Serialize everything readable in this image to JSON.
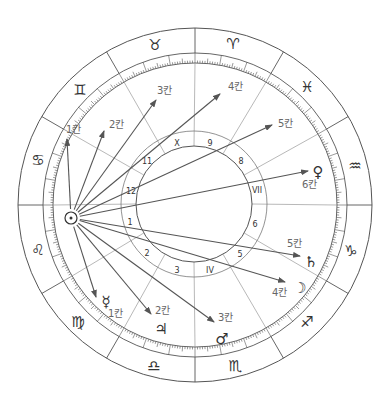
{
  "chart": {
    "center": [
      195,
      205
    ],
    "outer_radius": 177,
    "zodiac_inner_radius": 152,
    "scale_inner_radius": 142,
    "house_center": [
      194,
      204
    ],
    "house_outer_radius": 73,
    "house_inner_radius": 58,
    "line_color": "#555555",
    "arrow_color": "#555555"
  },
  "signs": [
    {
      "name": "aries",
      "glyph": "♈",
      "x": 233,
      "y": 44
    },
    {
      "name": "taurus",
      "glyph": "♉",
      "x": 155,
      "y": 45
    },
    {
      "name": "gemini",
      "glyph": "♊",
      "x": 80,
      "y": 90
    },
    {
      "name": "cancer",
      "glyph": "♋",
      "x": 38,
      "y": 160
    },
    {
      "name": "leo",
      "glyph": "♌",
      "x": 38,
      "y": 250
    },
    {
      "name": "virgo",
      "glyph": "♍",
      "x": 78,
      "y": 322
    },
    {
      "name": "libra",
      "glyph": "♎",
      "x": 154,
      "y": 366
    },
    {
      "name": "scorpio",
      "glyph": "♏",
      "x": 235,
      "y": 366
    },
    {
      "name": "sagittarius",
      "glyph": "♐",
      "x": 307,
      "y": 322
    },
    {
      "name": "capricorn",
      "glyph": "♑",
      "x": 351,
      "y": 251
    },
    {
      "name": "aquarius",
      "glyph": "♒",
      "x": 355,
      "y": 166
    },
    {
      "name": "pisces",
      "glyph": "♓",
      "x": 307,
      "y": 87
    }
  ],
  "houses": [
    {
      "label": "1",
      "x": 130,
      "y": 222
    },
    {
      "label": "2",
      "x": 147,
      "y": 253
    },
    {
      "label": "3",
      "x": 177,
      "y": 270
    },
    {
      "label": "IV",
      "x": 210,
      "y": 270
    },
    {
      "label": "5",
      "x": 240,
      "y": 254
    },
    {
      "label": "6",
      "x": 255,
      "y": 224
    },
    {
      "label": "VII",
      "x": 257,
      "y": 190
    },
    {
      "label": "8",
      "x": 241,
      "y": 161
    },
    {
      "label": "9",
      "x": 210,
      "y": 143
    },
    {
      "label": "X",
      "x": 177,
      "y": 143
    },
    {
      "label": "11",
      "x": 147,
      "y": 161
    },
    {
      "label": "12",
      "x": 131,
      "y": 191
    }
  ],
  "sun": {
    "name": "sun",
    "glyph": "☉",
    "x": 71,
    "y": 218,
    "r": 6
  },
  "aspects": [
    {
      "name": "arrow-1-up",
      "tip": [
        67,
        139
      ],
      "label": "1칸",
      "lx": 66,
      "ly": 133,
      "planet": null
    },
    {
      "name": "arrow-2-up",
      "tip": [
        104,
        131
      ],
      "label": "2칸",
      "lx": 109,
      "ly": 128,
      "planet": null
    },
    {
      "name": "arrow-3-up",
      "tip": [
        156,
        100
      ],
      "label": "3칸",
      "lx": 157,
      "ly": 94,
      "planet": null
    },
    {
      "name": "arrow-4-up",
      "tip": [
        220,
        94
      ],
      "label": "4칸",
      "lx": 228,
      "ly": 90,
      "planet": null
    },
    {
      "name": "arrow-5-up",
      "tip": [
        272,
        125
      ],
      "label": "5칸",
      "lx": 278,
      "ly": 127,
      "planet": null
    },
    {
      "name": "arrow-venus",
      "tip": [
        308,
        171
      ],
      "label": "6칸",
      "lx": 302,
      "ly": 188,
      "planet": {
        "name": "venus",
        "glyph": "♀",
        "x": 318,
        "y": 172
      }
    },
    {
      "name": "arrow-saturn",
      "tip": [
        300,
        256
      ],
      "label": "5칸",
      "lx": 287,
      "ly": 247,
      "planet": {
        "name": "saturn",
        "glyph": "♄",
        "x": 311,
        "y": 262
      }
    },
    {
      "name": "arrow-moon",
      "tip": [
        285,
        282
      ],
      "label": "4칸",
      "lx": 272,
      "ly": 296,
      "planet": {
        "name": "moon",
        "glyph": "☽",
        "x": 300,
        "y": 288
      }
    },
    {
      "name": "arrow-mars",
      "tip": [
        214,
        322
      ],
      "label": "3칸",
      "lx": 218,
      "ly": 321,
      "planet": {
        "name": "mars",
        "glyph": "♂",
        "x": 222,
        "y": 339
      }
    },
    {
      "name": "arrow-jupiter",
      "tip": [
        151,
        314
      ],
      "label": "2칸",
      "lx": 155,
      "ly": 314,
      "planet": {
        "name": "jupiter",
        "glyph": "♃",
        "x": 161,
        "y": 329
      }
    },
    {
      "name": "arrow-mercury",
      "tip": [
        96,
        297
      ],
      "label": "1칸",
      "lx": 108,
      "ly": 317,
      "planet": {
        "name": "mercury",
        "glyph": "☿",
        "x": 106,
        "y": 302
      }
    }
  ]
}
